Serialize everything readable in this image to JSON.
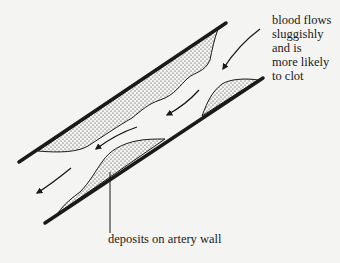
{
  "diagram": {
    "labels": {
      "flow": "blood flows\nsluggishly\nand is\nmore likely\nto clot",
      "deposits": "deposits on artery wall"
    },
    "colors": {
      "ink": "#1a1a1a",
      "background": "#f4f4f2",
      "stipple": "#2a2a2a"
    },
    "arrows": [
      {
        "name": "flow-arrow-entry",
        "direction": "down-left"
      },
      {
        "name": "flow-arrow-narrow",
        "direction": "down-left"
      },
      {
        "name": "flow-arrow-middle",
        "direction": "down-left"
      },
      {
        "name": "flow-arrow-exit",
        "direction": "down-left"
      }
    ]
  }
}
